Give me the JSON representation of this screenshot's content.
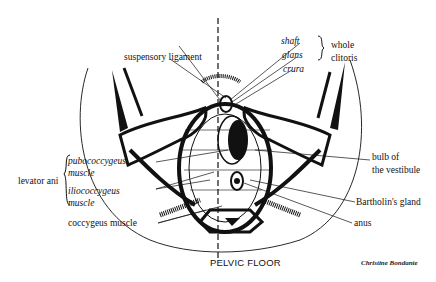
{
  "diagram": {
    "title": "PELVIC FLOOR",
    "credit": "Christine Bondante",
    "labels": {
      "suspensory_ligament": "suspensory ligament",
      "shaft": "shaft",
      "glans": "glans",
      "crura": "crura",
      "whole_clitoris_line1": "whole",
      "whole_clitoris_line2": "clitoris",
      "levator_ani": "levator ani",
      "pubococcygeus_line1": "pubococcygeus",
      "pubococcygeus_line2": "muscle",
      "iliococcygeus_line1": "iliococcygeus",
      "iliococcygeus_line2": "muscle",
      "coccygeus_muscle": "coccygeus muscle",
      "bulb_line1": "bulb of",
      "bulb_line2": "the vestibule",
      "bartholins_gland": "Bartholin's gland",
      "anus": "anus"
    },
    "colors": {
      "ink": "#111111",
      "background": "#ffffff"
    }
  }
}
